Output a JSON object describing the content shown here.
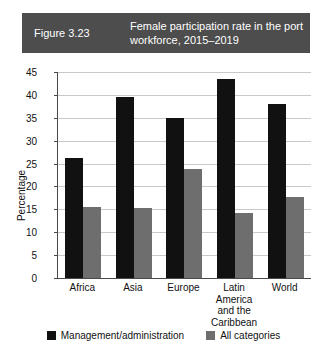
{
  "banner": {
    "figure_number": "Figure 3.23",
    "title": "Female participation rate in the port workforce, 2015–2019",
    "background_color": "#4d4d4d",
    "text_color": "#ffffff"
  },
  "chart_data": {
    "type": "bar",
    "title": "Female participation rate in the port workforce, 2015–2019",
    "xlabel": "",
    "ylabel": "Percentage",
    "ylim": [
      0,
      45
    ],
    "ytick_step": 5,
    "yticks": [
      0,
      5,
      10,
      15,
      20,
      25,
      30,
      35,
      40,
      45
    ],
    "ytick_labels": [
      "0",
      "5",
      "10",
      "15",
      "20",
      "25",
      "30",
      "35",
      "40",
      "45"
    ],
    "grid": true,
    "grid_axis": "y",
    "legend_position": "bottom",
    "categories": [
      "Africa",
      "Asia",
      "Europe",
      "Latin America and the Caribbean",
      "World"
    ],
    "category_label_lines": [
      [
        "Africa"
      ],
      [
        "Asia"
      ],
      [
        "Europe"
      ],
      [
        "Latin America",
        "and the",
        "Caribbean"
      ],
      [
        "World"
      ]
    ],
    "series": [
      {
        "name": "Management/administration",
        "color": "#111111",
        "values": [
          26.3,
          39.5,
          35.0,
          43.5,
          38.0
        ]
      },
      {
        "name": "All categories",
        "color": "#6e6e6e",
        "values": [
          15.6,
          15.4,
          23.9,
          14.2,
          17.7
        ]
      }
    ]
  }
}
